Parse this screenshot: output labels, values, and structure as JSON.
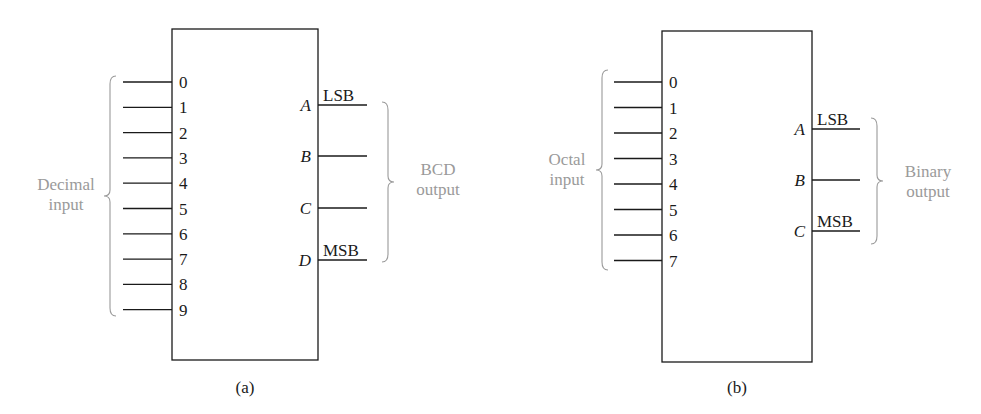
{
  "diagrams": [
    {
      "id": "a",
      "caption": "(a)",
      "box": {
        "x": 172,
        "y": 29,
        "w": 146,
        "h": 331
      },
      "inputs": {
        "labels": [
          "0",
          "1",
          "2",
          "3",
          "4",
          "5",
          "6",
          "7",
          "8",
          "9"
        ],
        "y_start": 82,
        "y_step": 25.3,
        "line_from": 123,
        "group_label": [
          "Decimal",
          "input"
        ],
        "group_label_pos": {
          "x": 66,
          "y": 190
        },
        "brace": {
          "x": 110,
          "y1": 76,
          "y2": 316
        }
      },
      "outputs": {
        "pins": [
          {
            "name": "A",
            "note": "LSB",
            "y": 105
          },
          {
            "name": "B",
            "note": "",
            "y": 156
          },
          {
            "name": "C",
            "note": "",
            "y": 208
          },
          {
            "name": "D",
            "note": "MSB",
            "y": 260
          }
        ],
        "line_to": 367,
        "group_label": [
          "BCD",
          "output"
        ],
        "group_label_pos": {
          "x": 438,
          "y": 175
        },
        "brace": {
          "x": 388,
          "y1": 102,
          "y2": 262
        }
      }
    },
    {
      "id": "b",
      "caption": "(b)",
      "box": {
        "x": 662,
        "y": 31,
        "w": 150,
        "h": 331
      },
      "inputs": {
        "labels": [
          "0",
          "1",
          "2",
          "3",
          "4",
          "5",
          "6",
          "7"
        ],
        "y_start": 82,
        "y_step": 25.5,
        "line_from": 614,
        "group_label": [
          "Octal",
          "input"
        ],
        "group_label_pos": {
          "x": 567,
          "y": 165
        },
        "brace": {
          "x": 602,
          "y1": 70,
          "y2": 270
        }
      },
      "outputs": {
        "pins": [
          {
            "name": "A",
            "note": "LSB",
            "y": 129
          },
          {
            "name": "B",
            "note": "",
            "y": 180
          },
          {
            "name": "C",
            "note": "MSB",
            "y": 231
          }
        ],
        "line_to": 860,
        "group_label": [
          "Binary",
          "output"
        ],
        "group_label_pos": {
          "x": 928,
          "y": 177
        },
        "brace": {
          "x": 877,
          "y1": 118,
          "y2": 244
        }
      }
    }
  ]
}
